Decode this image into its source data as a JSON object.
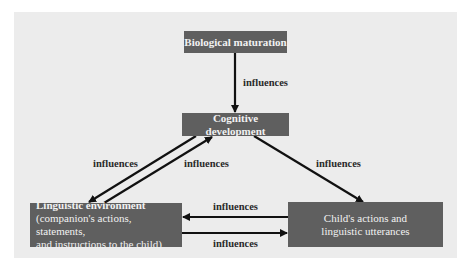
{
  "diagram": {
    "nodes": {
      "biological": {
        "label": "Biological maturation"
      },
      "cognitive": {
        "label": "Cognitive development"
      },
      "linguistic": {
        "line1": "Linguistic environment",
        "line2": "(companion's actions, statements,",
        "line3": "and instructions to the child)"
      },
      "child": {
        "line1": "Child's actions and",
        "line2": "linguistic utterances"
      }
    },
    "edges": [
      {
        "from": "biological",
        "to": "cognitive",
        "label": "influences"
      },
      {
        "from": "cognitive",
        "to": "linguistic",
        "label": "influences"
      },
      {
        "from": "linguistic",
        "to": "cognitive",
        "label": "influences"
      },
      {
        "from": "cognitive",
        "to": "child",
        "label": "influences"
      },
      {
        "from": "child",
        "to": "linguistic",
        "label": "influences"
      },
      {
        "from": "linguistic",
        "to": "child",
        "label": "influences"
      }
    ],
    "colors": {
      "panel": "#ececec",
      "node_fill": "#5f5f5f",
      "node_text": "#f2f2f2",
      "arrow": "#111111"
    }
  }
}
